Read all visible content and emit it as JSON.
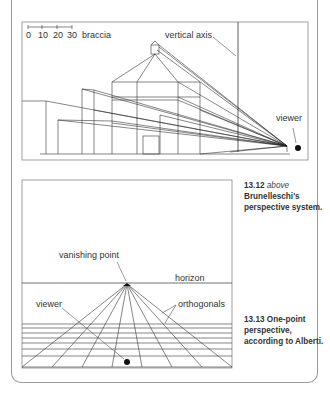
{
  "figure_top": {
    "scale": {
      "ticks": [
        "0",
        "10",
        "20",
        "30"
      ],
      "unit": "braccia"
    },
    "labels": {
      "vertical_axis": "vertical axis",
      "viewer": "viewer"
    }
  },
  "figure_bottom": {
    "labels": {
      "vanishing_point": "vanishing point",
      "horizon": "horizon",
      "orthogonals": "orthogonals",
      "viewer": "viewer"
    }
  },
  "captions": [
    {
      "number": "13.12",
      "position": "above",
      "text": "Brunelleschi's perspective system."
    },
    {
      "number": "13.13",
      "text": "One-point perspective, according to Alberti."
    }
  ],
  "colors": {
    "line": "#333333",
    "frame": "#9a9a9a",
    "text": "#333333"
  }
}
